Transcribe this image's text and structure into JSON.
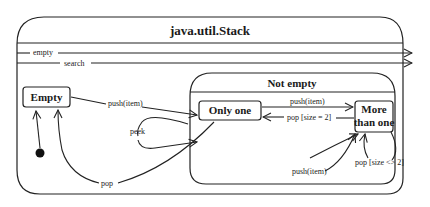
{
  "diagram": {
    "type": "UML state machine",
    "outer_state": {
      "title": "java.util.Stack"
    },
    "self_transitions": [
      {
        "label": "empty"
      },
      {
        "label": "search"
      }
    ],
    "composite_state": {
      "title": "Not empty"
    },
    "states": {
      "empty": "Empty",
      "only_one": "Only one",
      "more_than_one_line1": "More",
      "more_than_one_line2": "than one"
    },
    "transitions": {
      "empty_to_only_one": "push(item)",
      "peek": "peek",
      "only_one_to_empty": "pop",
      "only_one_to_more": "push(item)",
      "more_to_only_one": "pop [size = 2]",
      "more_push_self": "push(item)",
      "more_pop_self": "pop [size <> 2]"
    },
    "initial_pseudostate": "filled-circle"
  }
}
